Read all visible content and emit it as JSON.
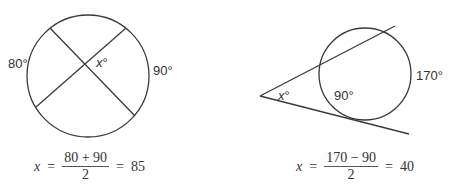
{
  "diagrams": [
    {
      "name": "intersecting-chords",
      "arc_left_label": "80°",
      "angle_label_var": "x",
      "angle_label_deg": "°",
      "arc_right_label": "90°",
      "equation": {
        "lhs": "x",
        "equals1": "=",
        "numerator": "80 + 90",
        "denominator": "2",
        "equals2": "=",
        "result": "85"
      }
    },
    {
      "name": "secant-tangent",
      "angle_label_var": "x",
      "angle_label_deg": "°",
      "near_arc_label": "90°",
      "far_arc_label": "170°",
      "equation": {
        "lhs": "x",
        "equals1": "=",
        "numerator": "170 − 90",
        "denominator": "2",
        "equals2": "=",
        "result": "40"
      }
    }
  ],
  "colors": {
    "stroke": "#3a3a3a",
    "text": "#333333",
    "background": "#ffffff"
  }
}
